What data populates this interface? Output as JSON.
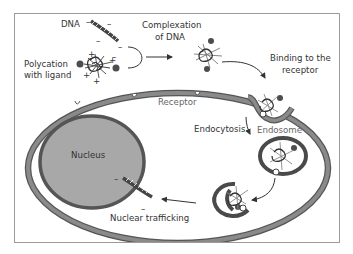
{
  "diagram": {
    "colors": {
      "frame": "#9a9a9a",
      "membrane": "#7a7a7a",
      "membrane_edge": "#555555",
      "nucleus_fill": "#a8a8a8",
      "nucleus_edge": "#555555",
      "endosome": "#4a4a4a",
      "ligand": "#4d4d4d",
      "text": "#333333",
      "text_grey": "#666666"
    },
    "labels": {
      "dna": "DNA",
      "polycation_line1": "Polycation",
      "polycation_line2": "with ligand",
      "complexation_line1": "Complexation",
      "complexation_line2": "of DNA",
      "binding_line1": "Binding to the",
      "binding_line2": "receptor",
      "receptor": "Receptor",
      "endocytosis": "Endocytosis",
      "endosome": "Endosome",
      "nucleus": "Nucleus",
      "nuclear_trafficking": "Nuclear trafficking"
    },
    "charges": {
      "negative": "–",
      "positive": "+"
    },
    "steps": [
      "Complexation of DNA",
      "Binding to the receptor",
      "Endocytosis",
      "Endosome",
      "Nuclear trafficking"
    ]
  }
}
